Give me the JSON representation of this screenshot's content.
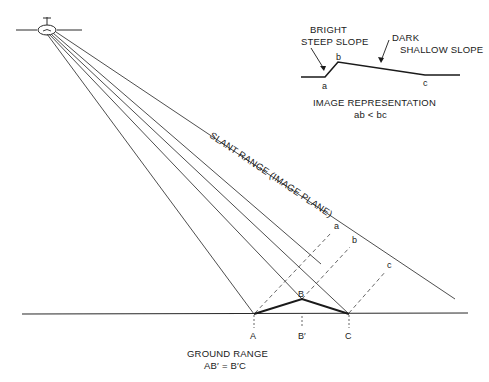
{
  "diagram": {
    "inset": {
      "bright_label_line1": "BRIGHT",
      "bright_label_line2": "STEEP SLOPE",
      "dark_label_line1": "DARK",
      "dark_label_line2": "SHALLOW SLOPE",
      "points": {
        "a": "a",
        "b": "b",
        "c": "c"
      },
      "caption_line1": "IMAGE REPRESENTATION",
      "caption_line2": "ab < bc"
    },
    "slant_range_label": "SLANT RANGE (IMAGE PLANE)",
    "slant_points": {
      "a": "a",
      "b": "b",
      "c": "c"
    },
    "ground_points": {
      "A": "A",
      "B": "B",
      "B_prime": "B′",
      "C": "C"
    },
    "ground_caption_line1": "GROUND RANGE",
    "ground_caption_line2": "AB′ = B′C",
    "icons": {
      "sensor": "satellite-sensor-icon"
    },
    "colors": {
      "line": "#2a2a2a",
      "background": "#ffffff"
    }
  }
}
